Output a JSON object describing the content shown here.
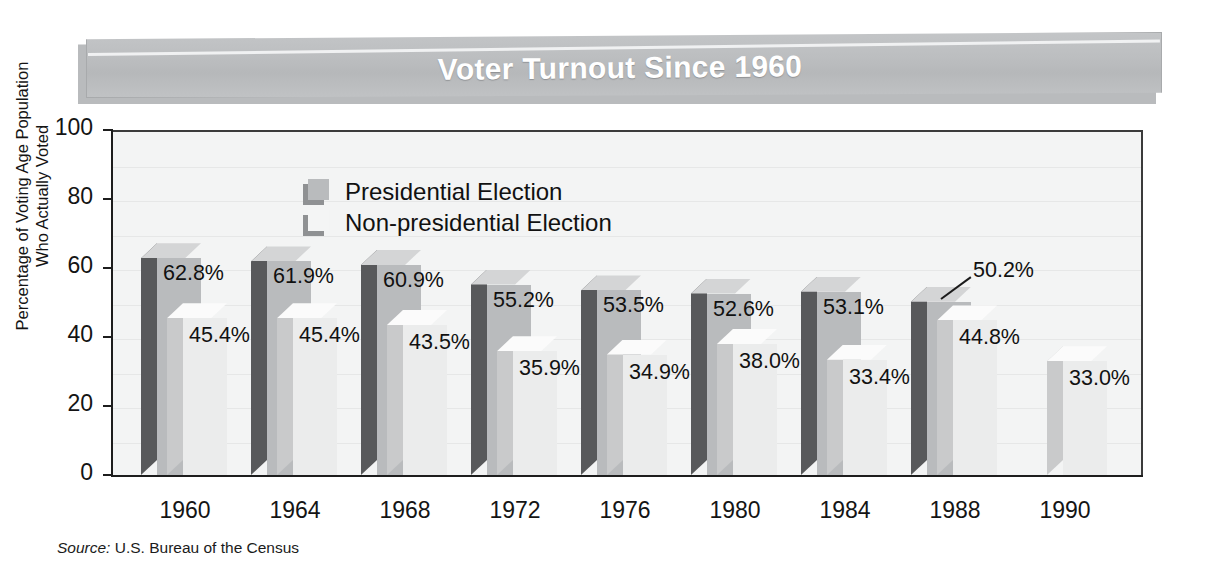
{
  "title": "Voter Turnout Since 1960",
  "source_prefix": "Source:",
  "source_text": " U.S. Bureau of the Census",
  "axis": {
    "y_title_line1": "Percentage of Voting Age Population",
    "y_title_line2": "Who Actually Voted"
  },
  "legend": {
    "items": [
      {
        "label": "Presidential Election",
        "color": "#b9bbbd"
      },
      {
        "label": "Non-presidential Election",
        "color": "#f4f5f5"
      }
    ]
  },
  "colors": {
    "presidential_face": "#b9bbbd",
    "presidential_side": "#58595b",
    "presidential_top": "#d4d5d6",
    "nonpresidential_face": "#ebecec",
    "nonpresidential_side": "#c9cacb",
    "nonpresidential_top": "#fbfbfb",
    "banner": "#bcbec0",
    "axis": "#1d1d1d",
    "plot_bg": "#f3f4f4"
  },
  "chart_data": {
    "type": "bar",
    "title": "Voter Turnout Since 1960",
    "xlabel": "",
    "ylabel": "Percentage of Voting Age Population Who Actually Voted",
    "ylim": [
      0,
      100
    ],
    "yticks": [
      0,
      20,
      40,
      60,
      80,
      100
    ],
    "grid": true,
    "legend_position": "upper-left-inside",
    "categories": [
      "1960",
      "1964",
      "1968",
      "1972",
      "1976",
      "1980",
      "1984",
      "1988",
      "1990"
    ],
    "series": [
      {
        "name": "Presidential Election",
        "values": [
          62.8,
          61.9,
          60.9,
          55.2,
          53.5,
          52.6,
          53.1,
          50.2,
          null
        ],
        "labels": [
          "62.8%",
          "61.9%",
          "60.9%",
          "55.2%",
          "53.5%",
          "52.6%",
          "53.1%",
          "50.2%",
          ""
        ]
      },
      {
        "name": "Non-presidential Election",
        "values": [
          45.4,
          45.4,
          43.5,
          35.9,
          34.9,
          38.0,
          33.4,
          44.8,
          33.0
        ],
        "labels": [
          "45.4%",
          "45.4%",
          "43.5%",
          "35.9%",
          "34.9%",
          "38.0%",
          "33.4%",
          "44.8%",
          "33.0%"
        ]
      }
    ],
    "annotations": [
      {
        "text": "50.2%",
        "points_to": "1988 presidential bar top",
        "leader_line": true
      }
    ]
  }
}
